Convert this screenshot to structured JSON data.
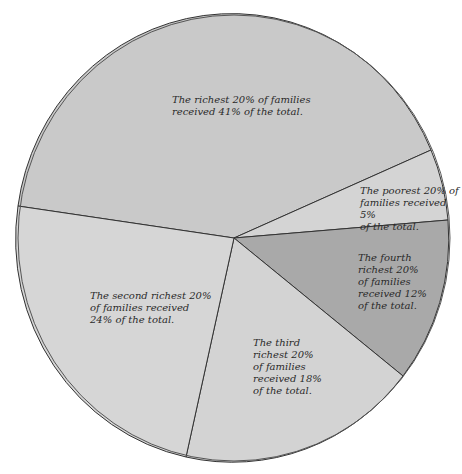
{
  "chart_data": {
    "type": "pie",
    "title": "",
    "categories": [
      "Richest 20%",
      "Poorest 20%",
      "Fourth richest 20%",
      "Third richest 20%",
      "Second richest 20%"
    ],
    "values": [
      41,
      5,
      12,
      18,
      24
    ],
    "unit": "% of total income",
    "colors": [
      "#c9c9c9",
      "#d4d4d4",
      "#a9a9a9",
      "#d3d3d3",
      "#d6d6d6"
    ],
    "annotations": [
      "The richest 20% of families received 41% of the total.",
      "The poorest 20% of families received 5% of the total.",
      "The fourth richest 20% of families received 12% of the total.",
      "The third richest 20% of families received 18% of the total.",
      "The second richest 20% of families received 24% of the total."
    ],
    "legend": "none"
  },
  "geometry": {
    "cx": 234,
    "cy": 238,
    "rx": 216,
    "ry": 223,
    "boundaries": [
      {
        "x": 431,
        "y": 150
      },
      {
        "x": 448,
        "y": 220
      },
      {
        "x": 403,
        "y": 376
      },
      {
        "x": 186,
        "y": 457
      },
      {
        "x": 18,
        "y": 206
      }
    ]
  },
  "labels": {
    "richest": "The richest 20% of families\nreceived 41% of the total.",
    "poorest": "The poorest 20% of\nfamilies received 5%\nof the total.",
    "fourth": "The fourth\nrichest 20%\nof families\nreceived 12%\nof the total.",
    "third": "The third\nrichest 20%\nof families\nreceived 18%\nof the total.",
    "second": "The second richest 20%\nof families received\n24% of the total."
  }
}
